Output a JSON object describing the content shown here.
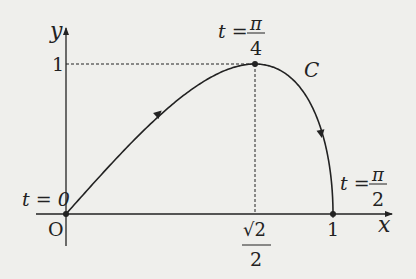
{
  "diagram": {
    "background": "#efefec",
    "ink": "#222222",
    "axes": {
      "x_label": "x",
      "y_label": "y",
      "origin_label": "O",
      "y_tick_label": "1",
      "x_tick_label": "1",
      "x_tick_sqrt_num": "√2",
      "x_tick_den": "2"
    },
    "curve": {
      "name": "C",
      "points": [
        {
          "t_label": "t = 0",
          "x": 0,
          "y": 0
        },
        {
          "t_num": "π",
          "t_den": "4",
          "t_prefix": "t =",
          "x": "√2/2",
          "y": 1
        },
        {
          "t_num": "π",
          "t_den": "2",
          "t_prefix": "t =",
          "x": 1,
          "y": 0
        }
      ]
    }
  }
}
